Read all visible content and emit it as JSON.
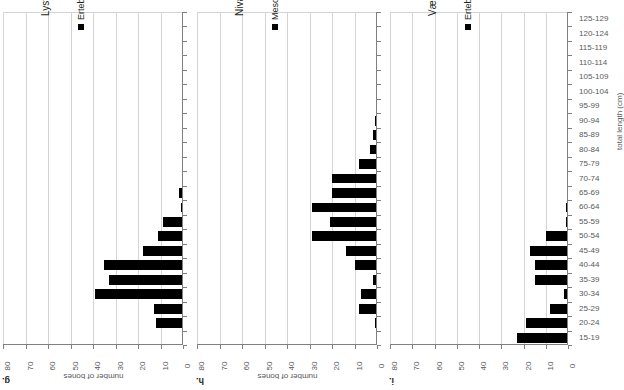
{
  "chart_data": [
    {
      "type": "bar",
      "panel": "g",
      "title": "Lystrup Enge, n = 171",
      "legend": [
        "Ertebølle culture"
      ],
      "legend_position": "top-left",
      "orientation": "horizontal-reversed",
      "xlabel": "number of bones",
      "ylabel": "total length (cm)",
      "xlim": [
        0,
        80
      ],
      "xticks": [
        "80",
        "70",
        "60",
        "50",
        "40",
        "30",
        "20",
        "10",
        "0"
      ],
      "grid": true,
      "categories": [
        "125-129",
        "120-124",
        "115-119",
        "110-114",
        "105-109",
        "100-104",
        "95-99",
        "90-94",
        "85-89",
        "80-84",
        "75-79",
        "70-74",
        "65-69",
        "60-64",
        "55-59",
        "50-54",
        "45-49",
        "40-44",
        "35-39",
        "30-34",
        "25-29",
        "20-24",
        "15-19"
      ],
      "values": [
        0,
        0,
        0,
        0,
        0,
        0,
        0,
        0,
        0,
        0,
        0,
        0,
        2,
        1,
        9,
        11,
        18,
        35,
        33,
        39,
        13,
        12,
        0
      ],
      "series_color": "#000000"
    },
    {
      "type": "bar",
      "panel": "h",
      "title": "Nivågård, n = 177",
      "legend": [
        "Mesolithic"
      ],
      "legend_position": "top-left",
      "orientation": "horizontal-reversed",
      "xlabel": "number of bones",
      "ylabel": "total length (cm)",
      "xlim": [
        0,
        80
      ],
      "xticks": [
        "80",
        "70",
        "60",
        "50",
        "40",
        "30",
        "20",
        "10",
        "0"
      ],
      "grid": true,
      "categories": [
        "125-129",
        "120-124",
        "115-119",
        "110-114",
        "105-109",
        "100-104",
        "95-99",
        "90-94",
        "85-89",
        "80-84",
        "75-79",
        "70-74",
        "65-69",
        "60-64",
        "55-59",
        "50-54",
        "45-49",
        "40-44",
        "35-39",
        "30-34",
        "25-29",
        "20-24",
        "15-19"
      ],
      "values": [
        0,
        0,
        0,
        0,
        0,
        0,
        0,
        1,
        2,
        3,
        8,
        20,
        20,
        29,
        21,
        29,
        14,
        10,
        2,
        7,
        8,
        1,
        0
      ],
      "series_color": "#000000"
    },
    {
      "type": "bar",
      "panel": "i",
      "title": "Vængsø III, n = 110",
      "legend": [
        "Ertebølle culture"
      ],
      "legend_position": "top-left",
      "orientation": "horizontal-reversed",
      "xlabel": "number of bones",
      "ylabel": "total length (cm)",
      "xlim": [
        0,
        80
      ],
      "xticks": [
        "80",
        "70",
        "60",
        "50",
        "40",
        "30",
        "20",
        "10",
        "0"
      ],
      "grid": true,
      "categories": [
        "125-129",
        "120-124",
        "115-119",
        "110-114",
        "105-109",
        "100-104",
        "95-99",
        "90-94",
        "85-89",
        "80-84",
        "75-79",
        "70-74",
        "65-69",
        "60-64",
        "55-59",
        "50-54",
        "45-49",
        "40-44",
        "35-39",
        "30-34",
        "25-29",
        "20-24",
        "15-19"
      ],
      "values": [
        0,
        0,
        0,
        0,
        0,
        0,
        0,
        0,
        0,
        0,
        0,
        0,
        0,
        1,
        1,
        10,
        17,
        15,
        15,
        2,
        8,
        19,
        23
      ],
      "series_color": "#000000"
    }
  ],
  "panels": {
    "g": {
      "letter": "g.",
      "title": "Lystrug Enge, n = 171",
      "legend_label": "Ertebølle culture",
      "axis_title": "number of bones"
    },
    "h": {
      "letter": "h.",
      "title": "Nivågård, n = 177",
      "legend_label": "Mesolithic",
      "axis_title": "number of bones"
    },
    "i": {
      "letter": "i.",
      "title": "Vængsø III, n = 110",
      "legend_label": "Ertebølle culture",
      "axis_title": "number of bones"
    }
  },
  "category_axis": {
    "title": "total length (cm)",
    "labels": [
      "125-129",
      "120-124",
      "115-119",
      "110-114",
      "105-109",
      "100-104",
      "95-99",
      "90-94",
      "85-89",
      "80-84",
      "75-79",
      "70-74",
      "65-69",
      "60-64",
      "55-59",
      "50-54",
      "45-49",
      "40-44",
      "35-39",
      "30-34",
      "25-29",
      "20-24",
      "15-19"
    ]
  },
  "value_axis": {
    "ticks": [
      "80",
      "70",
      "60",
      "50",
      "40",
      "30",
      "20",
      "10",
      "0"
    ]
  }
}
